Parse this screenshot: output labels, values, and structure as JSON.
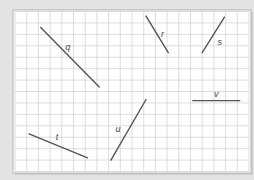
{
  "diagram": {
    "type": "grid-line-segments",
    "grid": {
      "columns": 20,
      "rows": 14
    },
    "colors": {
      "background": "#e3e3e3",
      "paper": "#ffffff",
      "grid": "#cfcfcf",
      "border": "#b5b5b5",
      "segment": "#555555",
      "label": "#444444"
    },
    "segments": [
      {
        "name": "q",
        "label": "q",
        "from": [
          2.2,
          1.4
        ],
        "to": [
          7.2,
          6.6
        ],
        "label_at": [
          4.5,
          3.1
        ]
      },
      {
        "name": "r",
        "label": "r",
        "from": [
          11.2,
          0.4
        ],
        "to": [
          13.1,
          3.6
        ],
        "label_at": [
          12.6,
          2.0
        ]
      },
      {
        "name": "s",
        "label": "s",
        "from": [
          17.9,
          0.5
        ],
        "to": [
          16.0,
          3.6
        ],
        "label_at": [
          17.5,
          2.7
        ]
      },
      {
        "name": "t",
        "label": "t",
        "from": [
          1.2,
          10.7
        ],
        "to": [
          6.2,
          12.8
        ],
        "label_at": [
          3.6,
          11.0
        ]
      },
      {
        "name": "u",
        "label": "u",
        "from": [
          11.2,
          7.7
        ],
        "to": [
          8.2,
          13.0
        ],
        "label_at": [
          8.8,
          10.3
        ]
      },
      {
        "name": "v",
        "label": "v",
        "from": [
          15.2,
          7.8
        ],
        "to": [
          19.2,
          7.8
        ],
        "label_at": [
          17.2,
          7.2
        ]
      }
    ]
  }
}
